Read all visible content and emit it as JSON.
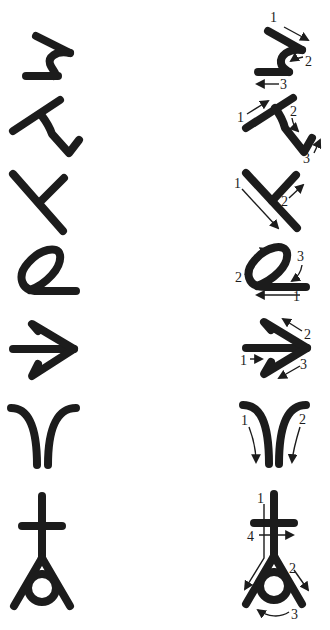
{
  "figure": {
    "ink_color": "#1c1c1c",
    "background_color": "#ffffff",
    "glyphs": [
      {
        "name": "hook-glyph",
        "strokes": 3,
        "labels": [
          "1",
          "2",
          "3"
        ]
      },
      {
        "name": "bent-glyph",
        "strokes": 3,
        "labels": [
          "1",
          "2",
          "3"
        ]
      },
      {
        "name": "t-glyph",
        "strokes": 2,
        "labels": [
          "1",
          "2"
        ]
      },
      {
        "name": "loop-glyph",
        "strokes": 3,
        "labels": [
          "1",
          "2",
          "3"
        ]
      },
      {
        "name": "arrow-glyph",
        "strokes": 3,
        "labels": [
          "1",
          "2",
          "3"
        ]
      },
      {
        "name": "arches-glyph",
        "strokes": 2,
        "labels": [
          "1",
          "2"
        ]
      },
      {
        "name": "cross-ring-glyph",
        "strokes": 4,
        "labels": [
          "1",
          "4",
          "2",
          "3"
        ]
      }
    ]
  }
}
